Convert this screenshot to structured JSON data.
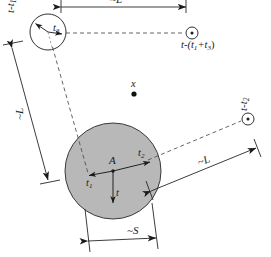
{
  "figure": {
    "background_color": "#ffffff",
    "stroke_color": "#1a1a1a",
    "disk_fill_color": "#b8b8b8",
    "dashed_color": "#4a4a4a"
  },
  "labels": {
    "top_dimension": "~L",
    "left_dimension": "~L",
    "right_dimension": "~L",
    "bottom_dimension": "~S",
    "upper_left_marker": "t-t",
    "upper_left_marker_sub": "1",
    "right_marker": "t-t",
    "right_marker_sub": "2",
    "far_right_marker_prefix": "t-(t",
    "far_right_marker_sub1": "1",
    "far_right_marker_mid": "+t",
    "far_right_marker_sub2": "3",
    "far_right_marker_suffix": ")",
    "small_circle_time": "t",
    "small_circle_time_sub": "3",
    "disk_center": "A",
    "disk_left_time": "t",
    "disk_left_time_sub": "1",
    "disk_right_time": "t",
    "disk_right_time_sub": "2",
    "disk_bottom_time": "t",
    "point_x": "x"
  },
  "geometry": {
    "small_circle": {
      "cx": 48,
      "cy": 32,
      "r": 18
    },
    "main_disk": {
      "cx": 113,
      "cy": 171,
      "r": 48
    },
    "marker_upper_right": {
      "cx": 192,
      "cy": 33,
      "r": 6
    },
    "marker_right": {
      "cx": 248,
      "cy": 119,
      "r": 6
    },
    "point_x": {
      "cx": 134,
      "cy": 94,
      "r": 2.6
    }
  }
}
